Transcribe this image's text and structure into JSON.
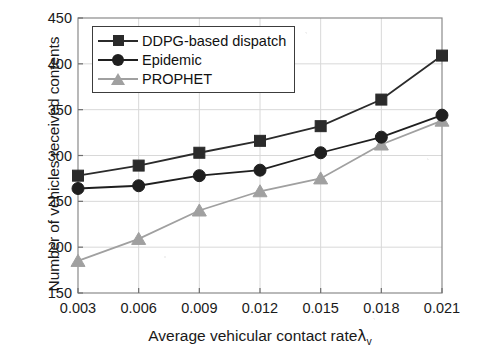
{
  "chart_data": {
    "type": "line",
    "title": "",
    "xlabel": "Average vehicular contact rate",
    "xlabel_symbol": "λ",
    "xlabel_symbol_sub": "v",
    "ylabel": "Number of vehicles received contents",
    "x": [
      0.003,
      0.006,
      0.009,
      0.012,
      0.015,
      0.018,
      0.021
    ],
    "xtick_labels": [
      "0.003",
      "0.006",
      "0.009",
      "0.012",
      "0.015",
      "0.018",
      "0.021"
    ],
    "ytick_labels": [
      "150",
      "200",
      "250",
      "300",
      "350",
      "400",
      "450"
    ],
    "yticks": [
      150,
      200,
      250,
      300,
      350,
      400,
      450
    ],
    "xlim": [
      0.003,
      0.021
    ],
    "ylim": [
      150,
      450
    ],
    "grid": true,
    "legend_position": "upper left",
    "series": [
      {
        "name": "DDPG-based dispatch",
        "marker": "square",
        "color": "#2b2b2b",
        "values": [
          278,
          289,
          303,
          316,
          332,
          361,
          409
        ]
      },
      {
        "name": "Epidemic",
        "marker": "circle",
        "color": "#1f1f1f",
        "values": [
          264,
          267,
          278,
          284,
          303,
          320,
          344
        ]
      },
      {
        "name": "PROPHET",
        "marker": "triangle",
        "color": "#a0a0a0",
        "values": [
          185,
          209,
          240,
          261,
          275,
          312,
          338
        ]
      }
    ]
  },
  "axes": {
    "frame_color": "#8a8a8a",
    "grid_color": "#d8d8d8",
    "tick_color": "#6e6e6e"
  }
}
